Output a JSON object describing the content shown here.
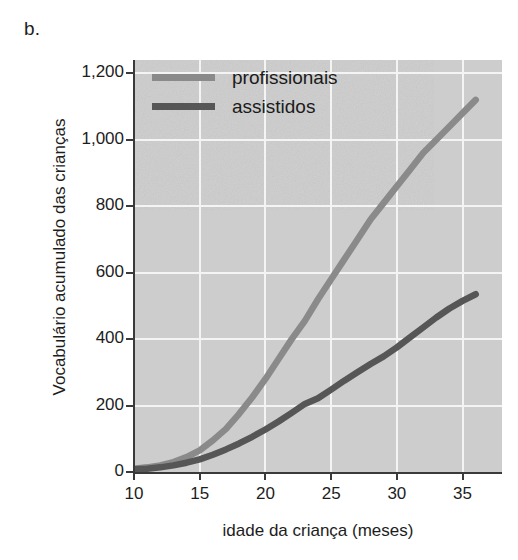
{
  "panel": {
    "label": "b."
  },
  "colors": {
    "professionals": "#8a8a8a",
    "welfare": "#565656",
    "plot_background": "#cdcdcd",
    "gridline": "#f4f4f4",
    "axis": "#3a3a3a",
    "text": "#1d1d1d"
  },
  "legend": {
    "position": "top-left-inside",
    "items": [
      {
        "label": "profissionais",
        "color": "#8a8a8a"
      },
      {
        "label": "assistidos",
        "color": "#565656"
      }
    ]
  },
  "axes": {
    "x": {
      "label": "idade da criança (meses)",
      "ticks": [
        10,
        15,
        20,
        25,
        30,
        35
      ],
      "tick_labels": [
        "10",
        "15",
        "20",
        "25",
        "30",
        "35"
      ],
      "min": 10,
      "max": 38
    },
    "y": {
      "label": "Vocabulário acumulado das crianças",
      "ticks": [
        0,
        200,
        400,
        600,
        800,
        1000,
        1200
      ],
      "tick_labels": [
        "0",
        "200",
        "400",
        "600",
        "800",
        "1,000",
        "1,200"
      ],
      "min": 0,
      "max": 1240
    }
  },
  "chart_data": {
    "type": "line",
    "title": "",
    "subtitle": "",
    "xlabel": "idade da criança (meses)",
    "ylabel": "Vocabulário acumulado das crianças",
    "xlim": [
      10,
      38
    ],
    "ylim": [
      0,
      1240
    ],
    "xticks": [
      10,
      15,
      20,
      25,
      30,
      35
    ],
    "yticks": [
      0,
      200,
      400,
      600,
      800,
      1000,
      1200
    ],
    "grid": true,
    "legend_position": "upper left",
    "annotations": [
      "b."
    ],
    "x": [
      10,
      11,
      12,
      13,
      14,
      15,
      16,
      17,
      18,
      19,
      20,
      21,
      22,
      23,
      24,
      25,
      26,
      27,
      28,
      29,
      30,
      31,
      32,
      33,
      34,
      35,
      36
    ],
    "series": [
      {
        "name": "profissionais",
        "color": "#8a8a8a",
        "values": [
          10,
          14,
          20,
          30,
          45,
          65,
          95,
          130,
          175,
          225,
          280,
          340,
          400,
          455,
          520,
          580,
          640,
          700,
          760,
          810,
          860,
          910,
          960,
          1000,
          1040,
          1080,
          1120
        ]
      },
      {
        "name": "assistidos",
        "color": "#565656",
        "values": [
          8,
          10,
          14,
          20,
          28,
          38,
          52,
          68,
          86,
          106,
          128,
          152,
          178,
          205,
          222,
          248,
          275,
          300,
          325,
          348,
          375,
          405,
          435,
          465,
          492,
          515,
          535
        ]
      }
    ]
  }
}
